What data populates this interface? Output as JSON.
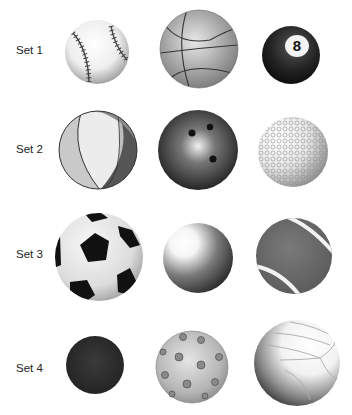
{
  "sets": [
    {
      "label": "Set 1",
      "balls": [
        "baseball",
        "basketball",
        "eight-ball"
      ]
    },
    {
      "label": "Set 2",
      "balls": [
        "beach-ball",
        "bowling-ball",
        "golf-ball"
      ]
    },
    {
      "label": "Set 3",
      "balls": [
        "soccer-ball",
        "plain-sphere",
        "tennis-ball"
      ]
    },
    {
      "label": "Set 4",
      "balls": [
        "rubber-ball",
        "wiffle-ball",
        "volleyball"
      ]
    }
  ],
  "eight_ball_number": "8"
}
